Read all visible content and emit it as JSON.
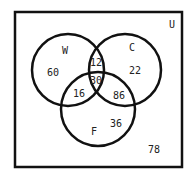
{
  "diagram": {
    "type": "venn",
    "universe_label": "U",
    "sets": [
      {
        "id": "W",
        "label": "W"
      },
      {
        "id": "C",
        "label": "C"
      },
      {
        "id": "F",
        "label": "F"
      }
    ],
    "regions": {
      "W_only": "60",
      "C_only": "22",
      "F_only": "36",
      "W_C_only": "12",
      "W_F_only": "16",
      "C_F_only": "86",
      "W_C_F": "30",
      "outside": "78"
    }
  }
}
